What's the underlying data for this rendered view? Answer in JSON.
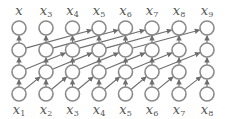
{
  "diagram": {
    "type": "dilated-causal-convolution",
    "columns": 8,
    "layers": 4,
    "colors": {
      "node_stroke": "#8a8a8a",
      "edge": "#6e6e6e",
      "label": "#555555"
    },
    "layout": {
      "col_x": [
        19,
        46,
        72.5,
        99,
        125.5,
        152,
        179,
        207
      ],
      "row_y": [
        28,
        50,
        72,
        94
      ],
      "node_radius": 7,
      "top_label_y": 15,
      "bottom_label_y": 114
    },
    "top_labels": [
      {
        "base": "x",
        "sub": ""
      },
      {
        "base": "x",
        "sub": "3"
      },
      {
        "base": "x",
        "sub": "4"
      },
      {
        "base": "x",
        "sub": "5"
      },
      {
        "base": "x",
        "sub": "6"
      },
      {
        "base": "x",
        "sub": "7"
      },
      {
        "base": "x",
        "sub": "8"
      },
      {
        "base": "x",
        "sub": "9"
      }
    ],
    "bottom_labels": [
      {
        "base": "x",
        "sub": "1"
      },
      {
        "base": "x",
        "sub": "2"
      },
      {
        "base": "x",
        "sub": "3"
      },
      {
        "base": "x",
        "sub": "4"
      },
      {
        "base": "x",
        "sub": "5"
      },
      {
        "base": "x",
        "sub": "6"
      },
      {
        "base": "x",
        "sub": "7"
      },
      {
        "base": "x",
        "sub": "8"
      }
    ],
    "dilations": [
      {
        "from_row": 3,
        "to_row": 2,
        "skip": 1
      },
      {
        "from_row": 2,
        "to_row": 1,
        "skip": 2
      },
      {
        "from_row": 1,
        "to_row": 0,
        "skip": 3
      }
    ]
  }
}
